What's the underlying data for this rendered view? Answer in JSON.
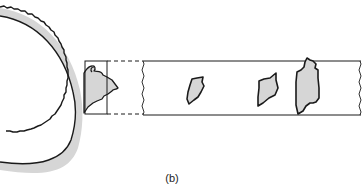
{
  "figure": {
    "caption": "(b)",
    "colors": {
      "stroke": "#1a1a1a",
      "fill": "#d6d6d6",
      "background": "#ffffff"
    },
    "elements": [
      {
        "name": "ring-section",
        "description": "section of circular ring with jagged outer surface"
      },
      {
        "name": "magnified-box",
        "description": "small rectangle outlining protrusion region"
      },
      {
        "name": "expanded-strip",
        "description": "long strip showing enlarged view with three shaded particles"
      }
    ],
    "particles": [
      {
        "id": 1,
        "label": "particle-1"
      },
      {
        "id": 2,
        "label": "particle-2"
      },
      {
        "id": 3,
        "label": "particle-3"
      }
    ]
  }
}
